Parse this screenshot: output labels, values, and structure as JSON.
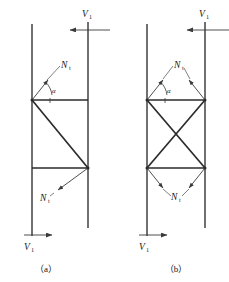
{
  "figure": {
    "background_color": "#ffffff",
    "line_color": "#2b2b2b",
    "force_color": "#3a3a3a",
    "leader_color": "#555555"
  },
  "labels": {
    "force_symbol": "N",
    "force_subscript": "t",
    "shear_symbol": "V",
    "shear_subscript": "1",
    "angle_symbol": "α"
  },
  "panels": [
    {
      "id": "panel-a",
      "caption": "（a）",
      "brace_type": "single-diagonal",
      "brace_count": 1,
      "force_labels": [
        {
          "id": "a-force-top",
          "text_main": "N",
          "text_sub": "t",
          "x": 62,
          "y": 69
        },
        {
          "id": "a-force-bottom",
          "text_main": "N",
          "text_sub": "t",
          "x": 41,
          "y": 200
        }
      ],
      "angle_label": {
        "id": "a-angle",
        "text": "α",
        "x": 53,
        "y": 92
      },
      "shear_labels": [
        {
          "id": "a-shear-top",
          "text_main": "V",
          "text_sub": "1",
          "x": 82,
          "y": 14,
          "direction": "left"
        },
        {
          "id": "a-shear-bottom",
          "text_main": "V",
          "text_sub": "1",
          "x": 25,
          "y": 246,
          "direction": "right"
        }
      ]
    },
    {
      "id": "panel-b",
      "caption": "（b）",
      "brace_type": "cross-X-bracing",
      "brace_count": 2,
      "force_labels": [
        {
          "id": "b-force-top",
          "text_main": "N",
          "text_sub": "t",
          "x": 175,
          "y": 69
        },
        {
          "id": "b-force-bottom",
          "text_main": "N",
          "text_sub": "t",
          "x": 168,
          "y": 198
        }
      ],
      "angle_label": {
        "id": "b-angle",
        "text": "α",
        "x": 168,
        "y": 92
      },
      "shear_labels": [
        {
          "id": "b-shear-top",
          "text_main": "V",
          "text_sub": "1",
          "x": 199,
          "y": 14,
          "direction": "left"
        },
        {
          "id": "b-shear-bottom",
          "text_main": "V",
          "text_sub": "1",
          "x": 140,
          "y": 246,
          "direction": "right"
        }
      ]
    }
  ],
  "captions": {
    "panel_a": "（a）",
    "panel_b": "（b）"
  },
  "geometry": {
    "panel_a": {
      "left_column_x": 32,
      "right_column_x": 88,
      "column_top_y": 24,
      "column_bottom_y": 236,
      "upper_beam_y": 100,
      "lower_beam_y": 168
    },
    "panel_b": {
      "left_column_x": 147,
      "right_column_x": 205,
      "column_top_y": 24,
      "column_bottom_y": 236,
      "upper_beam_y": 100,
      "lower_beam_y": 168
    }
  }
}
